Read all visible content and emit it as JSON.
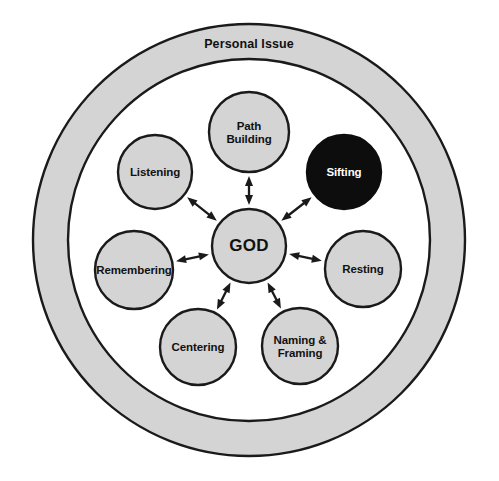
{
  "diagram": {
    "title": "Personal Issue",
    "center": {
      "label": "GOD",
      "cx": 249,
      "cy": 246,
      "r": 37,
      "fill": "#d4d4d4",
      "text_color": "#111111"
    },
    "outer_ring": {
      "label": "Personal Issue",
      "cx": 249,
      "cy": 240,
      "outer_r": 216,
      "inner_r": 181,
      "fill": "#d4d4d4",
      "stroke": "#1a1a1a",
      "label_x": 249,
      "label_y": 45
    },
    "connector_style": "double-headed-arrow",
    "nodes": [
      {
        "id": "path-building",
        "lines": [
          "Path",
          "Building"
        ],
        "cx": 249,
        "cy": 132,
        "r": 40,
        "fill": "#d4d4d4",
        "text_color": "#111111",
        "dark": false
      },
      {
        "id": "sifting",
        "lines": [
          "Sifting"
        ],
        "cx": 344,
        "cy": 172,
        "r": 37,
        "fill": "#0d0d0d",
        "text_color": "#ffffff",
        "dark": true
      },
      {
        "id": "resting",
        "lines": [
          "Resting"
        ],
        "cx": 363,
        "cy": 269,
        "r": 38,
        "fill": "#d4d4d4",
        "text_color": "#111111",
        "dark": false
      },
      {
        "id": "naming-framing",
        "lines": [
          "Naming &",
          "Framing"
        ],
        "cx": 300,
        "cy": 346,
        "r": 38,
        "fill": "#d4d4d4",
        "text_color": "#111111",
        "dark": false
      },
      {
        "id": "centering",
        "lines": [
          "Centering"
        ],
        "cx": 198,
        "cy": 347,
        "r": 38,
        "fill": "#d4d4d4",
        "text_color": "#111111",
        "dark": false
      },
      {
        "id": "remembering",
        "lines": [
          "Remembering"
        ],
        "cx": 134,
        "cy": 270,
        "r": 39,
        "fill": "#d4d4d4",
        "text_color": "#111111",
        "dark": false
      },
      {
        "id": "listening",
        "lines": [
          "Listening"
        ],
        "cx": 155,
        "cy": 172,
        "r": 37,
        "fill": "#d4d4d4",
        "text_color": "#111111",
        "dark": false
      }
    ],
    "colors": {
      "node_fill": "#d4d4d4",
      "highlight_fill": "#0d0d0d",
      "stroke": "#1a1a1a",
      "background": "#ffffff",
      "label": "#111111",
      "label_inverted": "#ffffff"
    }
  }
}
